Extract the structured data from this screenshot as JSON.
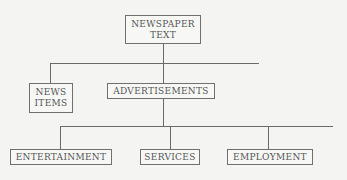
{
  "diagram": {
    "type": "hierarchy-tree",
    "root": {
      "id": "newspaper-text",
      "lines": [
        "NEWSPAPER",
        "TEXT"
      ]
    },
    "level1": [
      {
        "id": "news-items",
        "lines": [
          "NEWS",
          "ITEMS"
        ]
      },
      {
        "id": "advertisements",
        "lines": [
          "ADVERTISEMENTS"
        ]
      }
    ],
    "level2": [
      {
        "id": "entertainment",
        "lines": [
          "ENTERTAINMENT"
        ]
      },
      {
        "id": "services",
        "lines": [
          "SERVICES"
        ]
      },
      {
        "id": "employment",
        "lines": [
          "EMPLOYMENT"
        ]
      }
    ],
    "edges": [
      [
        "newspaper-text",
        "news-items"
      ],
      [
        "newspaper-text",
        "advertisements"
      ],
      [
        "advertisements",
        "entertainment"
      ],
      [
        "advertisements",
        "services"
      ],
      [
        "advertisements",
        "employment"
      ]
    ],
    "colors": {
      "background": "#f4f4f2",
      "line": "#6a6a6a",
      "text": "#555555"
    }
  }
}
